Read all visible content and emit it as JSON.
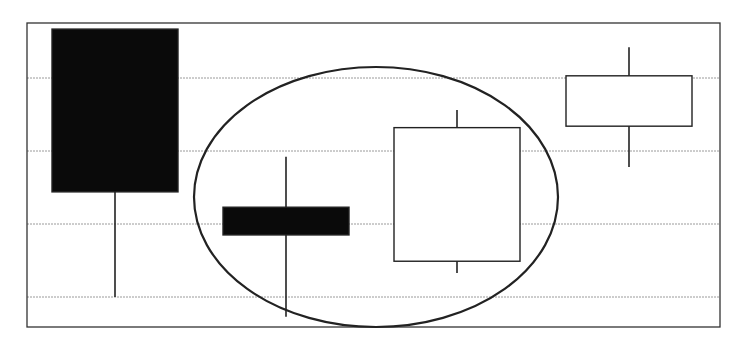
{
  "chart_data": {
    "type": "candlestick",
    "title": "",
    "xlabel": "",
    "ylabel": "",
    "grid": true,
    "legend": null,
    "categories": [
      "1",
      "2",
      "3",
      "4"
    ],
    "ylim": [
      -0.41,
      3.77
    ],
    "gridlines_y": [
      0,
      1,
      2,
      3
    ],
    "candles": [
      {
        "x": "1",
        "open": 3.67,
        "close": 1.44,
        "high": 3.67,
        "low": 0.0,
        "color": "black",
        "direction": "down"
      },
      {
        "x": "2",
        "open": 1.23,
        "close": 0.85,
        "high": 1.92,
        "low": -0.27,
        "color": "black",
        "direction": "down"
      },
      {
        "x": "3",
        "open": 0.49,
        "close": 2.32,
        "high": 2.56,
        "low": 0.33,
        "color": "white",
        "direction": "up"
      },
      {
        "x": "4",
        "open": 2.34,
        "close": 3.03,
        "high": 3.42,
        "low": 1.78,
        "color": "white",
        "direction": "up"
      }
    ],
    "annotations": [
      {
        "type": "ellipse",
        "encloses": [
          "2",
          "3"
        ],
        "description": "circled middle two candles"
      }
    ]
  },
  "colors": {
    "background": "#ffffff",
    "frame": "#333333",
    "gridline": "#9a9a9a",
    "bear_body": "#0a0a0a",
    "bull_body": "#ffffff",
    "outline": "#222222"
  }
}
